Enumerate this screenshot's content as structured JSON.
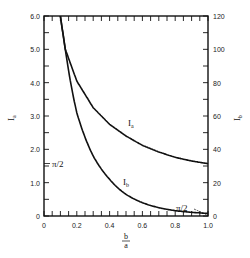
{
  "chart_data": {
    "type": "line",
    "title": "",
    "xlabel": "b/a",
    "xlabel_num": "b",
    "xlabel_den": "a",
    "ylabel_left": "I_a",
    "ylabel_right": "I_b",
    "xlim": [
      0,
      1.0
    ],
    "ylim_left": [
      0,
      6.0
    ],
    "ylim_right": [
      0,
      120
    ],
    "x_ticks": [
      "0",
      "0.2",
      "0.4",
      "0.6",
      "0.8",
      "1.0"
    ],
    "y_left_ticks": [
      "0",
      "1.0",
      "2.0",
      "3.0",
      "4.0",
      "5.0",
      "6.0"
    ],
    "y_right_ticks": [
      "0",
      "20",
      "40",
      "60",
      "80",
      "100",
      "120"
    ],
    "grid": false,
    "legend": "none",
    "annotations": [
      {
        "text": "π/2",
        "position": "left axis, at I_a = π/2"
      },
      {
        "text": "π/2",
        "position": "lower right, I_b endpoint at b/a = 1.0"
      }
    ],
    "series": [
      {
        "name": "I_a",
        "axis": "left",
        "x": [
          0.1,
          0.13,
          0.2,
          0.3,
          0.4,
          0.5,
          0.6,
          0.7,
          0.8,
          0.9,
          1.0
        ],
        "y": [
          6.0,
          5.0,
          4.05,
          3.25,
          2.75,
          2.4,
          2.12,
          1.92,
          1.76,
          1.65,
          1.57
        ]
      },
      {
        "name": "I_b",
        "axis": "right",
        "x": [
          0.1,
          0.13,
          0.2,
          0.3,
          0.4,
          0.5,
          0.6,
          0.7,
          0.8,
          0.9,
          1.0
        ],
        "y": [
          120,
          100,
          62,
          36,
          22,
          13,
          8,
          5,
          3.2,
          2.2,
          1.57
        ]
      }
    ]
  },
  "labels": {
    "ia": "I",
    "ia_sub": "a",
    "ib": "I",
    "ib_sub": "b",
    "pi_half_left": "π/2",
    "pi_half_right": "π/2",
    "y_left": "I",
    "y_left_sub": "a",
    "y_right": "I",
    "y_right_sub": "b",
    "x_num": "b",
    "x_den": "a",
    "x0": "0",
    "x02": "0.2",
    "x04": "0.4",
    "x06": "0.6",
    "x08": "0.8",
    "x10": "1.0",
    "yl0": "0",
    "yl1": "1.0",
    "yl2": "2.0",
    "yl3": "3.0",
    "yl4": "4.0",
    "yl5": "5.0",
    "yl6": "6.0",
    "yr0": "0",
    "yr20": "20",
    "yr40": "40",
    "yr60": "60",
    "yr80": "80",
    "yr100": "100",
    "yr120": "120"
  }
}
